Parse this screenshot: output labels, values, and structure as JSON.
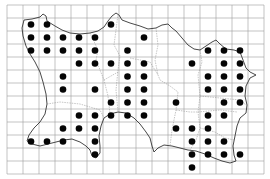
{
  "map": {
    "type": "distribution-grid-map",
    "background": "#ffffff",
    "grid": {
      "x_lines": [
        7,
        23,
        39,
        55,
        71,
        87,
        103,
        119,
        136,
        152,
        168,
        184,
        200,
        216,
        232,
        248,
        264
      ],
      "y_lines": [
        5,
        18,
        31,
        44,
        57,
        70,
        83,
        96,
        109,
        122,
        135,
        148,
        161,
        174
      ],
      "color": "#9a9a9a"
    },
    "dot_color": "#050505",
    "dot_radius": 3.3,
    "occupied_cells": [
      {
        "row": 1,
        "cols": [
          1,
          2,
          6
        ]
      },
      {
        "row": 2,
        "cols": [
          1,
          2,
          3,
          4,
          5,
          8
        ]
      },
      {
        "row": 3,
        "cols": [
          1,
          2,
          3,
          4,
          5,
          7,
          12,
          13,
          14
        ]
      },
      {
        "row": 4,
        "cols": [
          4,
          5,
          6,
          7,
          8,
          11,
          13,
          14
        ]
      },
      {
        "row": 5,
        "cols": [
          3,
          7,
          8,
          12,
          13,
          14
        ]
      },
      {
        "row": 6,
        "cols": [
          3,
          5,
          7,
          8,
          12,
          13,
          14
        ]
      },
      {
        "row": 7,
        "cols": [
          6,
          7,
          8,
          10,
          13,
          14
        ]
      },
      {
        "row": 8,
        "cols": [
          4,
          5,
          6,
          7,
          8,
          12,
          13
        ]
      },
      {
        "row": 9,
        "cols": [
          3,
          4,
          5,
          10,
          11,
          12
        ]
      },
      {
        "row": 10,
        "cols": [
          1,
          2,
          3,
          5,
          11,
          12,
          13
        ]
      },
      {
        "row": 11,
        "cols": [
          5,
          11,
          12,
          13,
          14
        ]
      },
      {
        "row": 12,
        "cols": [
          11
        ]
      }
    ]
  }
}
